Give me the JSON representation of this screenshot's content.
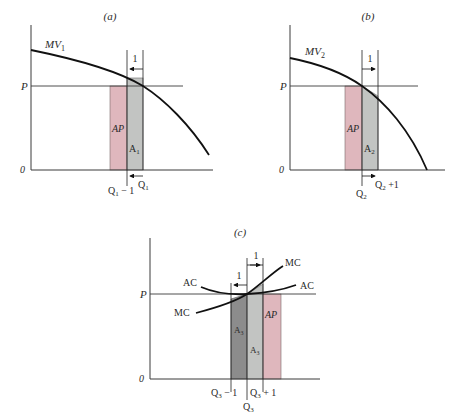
{
  "colors": {
    "axis": "#3a3a3a",
    "curve": "#111111",
    "ap_fill": "#dfb7bd",
    "a_light_fill": "#c2c4c2",
    "a_dark_fill": "#8c8c8c",
    "text": "#2a2a2a"
  },
  "panel_a": {
    "title": "(a)",
    "p_label": "P",
    "zero_label": "0",
    "curve_label": "MV",
    "curve_sub": "1",
    "unit_label": "1",
    "ap_label": "AP",
    "area_label": "A",
    "area_sub": "1",
    "q_left_label": "Q",
    "q_left_sub": "1",
    "q_left_suffix": " − 1",
    "q_right_label": "Q",
    "q_right_sub": "1"
  },
  "panel_b": {
    "title": "(b)",
    "p_label": "P",
    "zero_label": "0",
    "curve_label": "MV",
    "curve_sub": "2",
    "unit_label": "1",
    "ap_label": "AP",
    "area_label": "A",
    "area_sub": "2",
    "q_left_label": "Q",
    "q_left_sub": "2",
    "q_right_label": "Q",
    "q_right_sub": "2",
    "q_right_suffix": " +1"
  },
  "panel_c": {
    "title": "(c)",
    "p_label": "P",
    "zero_label": "0",
    "ac_label_left": "AC",
    "ac_label_right": "AC",
    "mc_label_left": "MC",
    "mc_label_right": "MC",
    "unit_label_left": "1",
    "unit_label_right": "1",
    "ap_label": "AP",
    "area_dark_label": "A",
    "area_dark_sub": "3",
    "area_light_label": "A",
    "area_light_sub": "3",
    "q_minus_label": "Q",
    "q_minus_sub": "3",
    "q_minus_suffix": " − 1",
    "q_plus_label": "Q",
    "q_plus_sub": "3",
    "q_plus_suffix": " + 1",
    "q_center_label": "Q",
    "q_center_sub": "3"
  }
}
